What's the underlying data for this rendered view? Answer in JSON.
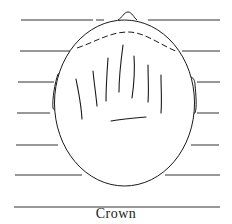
{
  "figure": {
    "caption": "Crown",
    "view": "top-down head outline",
    "stroke_color": "#1a1a1a",
    "background": "#ffffff"
  },
  "guide_lines": [
    {
      "y": 20,
      "left": [
        21,
        104
      ],
      "right": [
        148,
        220
      ]
    },
    {
      "y": 51,
      "left": [
        20,
        70
      ],
      "right": [
        182,
        220
      ]
    },
    {
      "y": 82,
      "left": [
        18,
        54
      ],
      "right": [
        197,
        220
      ]
    },
    {
      "y": 113,
      "left": [
        17,
        50
      ],
      "right": [
        197,
        219
      ]
    },
    {
      "y": 145,
      "left": [
        16,
        58
      ],
      "right": [
        191,
        219
      ]
    },
    {
      "y": 175,
      "left": [
        15,
        82
      ],
      "right": [
        165,
        220
      ]
    },
    {
      "y": 207,
      "left": [
        14,
        220
      ],
      "right": null
    }
  ]
}
